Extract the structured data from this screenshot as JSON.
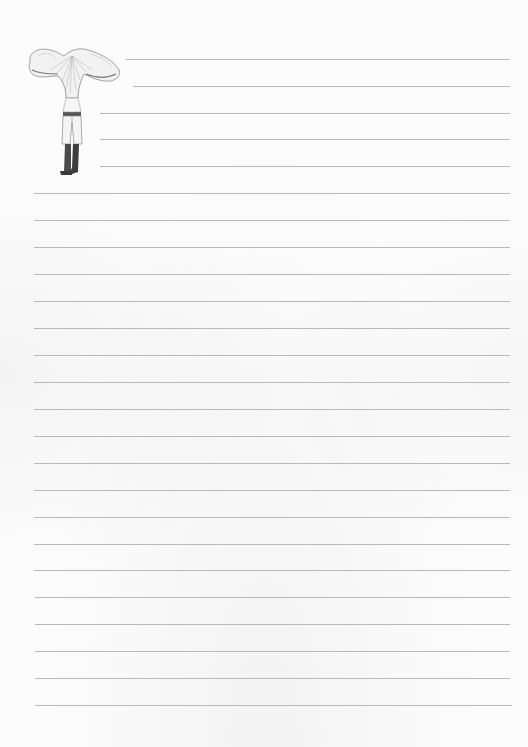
{
  "document": {
    "type": "lined-notepaper",
    "rule_color": "#b9b9b9",
    "background_color": "#fcfcfc",
    "illustration": {
      "name": "mushroom-headed-figure",
      "description": "Pencil-style drawing of a figure with a chanterelle mushroom cap for a head, wearing trousers and tall boots"
    },
    "rules": [
      {
        "y": 59,
        "x1": 126,
        "x2": 510
      },
      {
        "y": 86,
        "x1": 133,
        "x2": 510
      },
      {
        "y": 113,
        "x1": 100,
        "x2": 510
      },
      {
        "y": 139,
        "x1": 100,
        "x2": 510
      },
      {
        "y": 166,
        "x1": 100,
        "x2": 510
      },
      {
        "y": 193,
        "x1": 34,
        "x2": 510
      },
      {
        "y": 220,
        "x1": 34,
        "x2": 510
      },
      {
        "y": 247,
        "x1": 34,
        "x2": 510
      },
      {
        "y": 274,
        "x1": 34,
        "x2": 510
      },
      {
        "y": 301,
        "x1": 34,
        "x2": 510
      },
      {
        "y": 328,
        "x1": 34,
        "x2": 510
      },
      {
        "y": 355,
        "x1": 34,
        "x2": 510
      },
      {
        "y": 382,
        "x1": 34,
        "x2": 510
      },
      {
        "y": 409,
        "x1": 34,
        "x2": 510
      },
      {
        "y": 436,
        "x1": 34,
        "x2": 510
      },
      {
        "y": 463,
        "x1": 34,
        "x2": 510
      },
      {
        "y": 490,
        "x1": 34,
        "x2": 510
      },
      {
        "y": 517,
        "x1": 34,
        "x2": 510
      },
      {
        "y": 544,
        "x1": 34,
        "x2": 510
      },
      {
        "y": 570,
        "x1": 34,
        "x2": 510
      },
      {
        "y": 597,
        "x1": 35,
        "x2": 510
      },
      {
        "y": 624,
        "x1": 35,
        "x2": 510
      },
      {
        "y": 651,
        "x1": 35,
        "x2": 510
      },
      {
        "y": 678,
        "x1": 35,
        "x2": 510
      },
      {
        "y": 705,
        "x1": 35,
        "x2": 512
      }
    ]
  }
}
